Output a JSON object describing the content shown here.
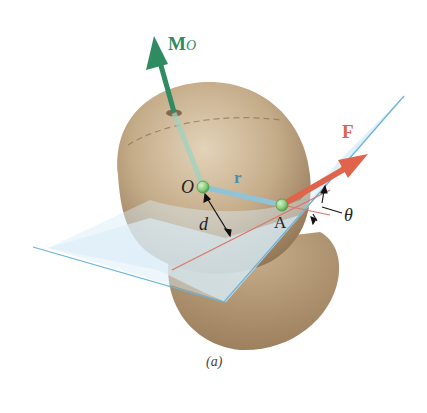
{
  "figure": {
    "caption": "(a)",
    "labels": {
      "moment": "M",
      "moment_sub": "O",
      "force": "F",
      "origin": "O",
      "point": "A",
      "position_vector": "r",
      "distance": "d",
      "angle": "θ"
    },
    "colors": {
      "moment_arrow": "#2e8b62",
      "force_arrow": "#e0634b",
      "position_vector": "#8fc4d8",
      "plane_edge": "#6ab4dc",
      "plane_fill": "#d7ecf6",
      "body": "#b59a76",
      "line_of_action": "#d9776a",
      "point_marker": "#8ccf7e",
      "label_dark": "#222222",
      "label_moment": "#2e8b62",
      "label_force": "#e0634b",
      "label_r": "#4a8fb0"
    }
  }
}
